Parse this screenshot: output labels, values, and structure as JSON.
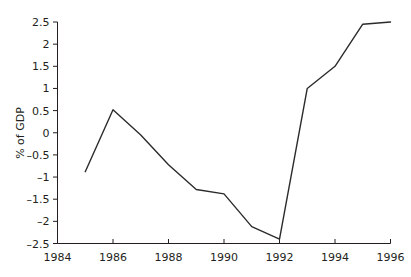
{
  "chart_data": {
    "type": "line",
    "title": "",
    "xlabel": "",
    "ylabel": "% of GDP",
    "x": [
      1985,
      1986,
      1987,
      1988,
      1989,
      1990,
      1991,
      1992,
      1993,
      1994,
      1995,
      1996
    ],
    "values": [
      -0.88,
      0.52,
      -0.05,
      -0.72,
      -1.28,
      -1.38,
      -2.12,
      -2.4,
      1.0,
      1.5,
      2.45,
      2.5
    ],
    "series": [
      {
        "name": "% of GDP",
        "values": [
          -0.88,
          0.52,
          -0.05,
          -0.72,
          -1.28,
          -1.38,
          -2.12,
          -2.4,
          1.0,
          1.5,
          2.45,
          2.5
        ]
      }
    ],
    "xlim": [
      1984,
      1996
    ],
    "ylim": [
      -2.5,
      2.5
    ],
    "xticks": [
      1984,
      1986,
      1988,
      1990,
      1992,
      1994,
      1996
    ],
    "xtick_labels": [
      "1984",
      "1986",
      "1988",
      "1990",
      "1992",
      "1994",
      "1996"
    ],
    "yticks": [
      2.5,
      2,
      1.5,
      1,
      0.5,
      0,
      -0.5,
      -1,
      -1.5,
      -2,
      -2.5
    ],
    "ytick_labels": [
      "2.5",
      "2",
      "1.5",
      "1",
      "0.5",
      "0",
      "–0.5",
      "–1",
      "–1.5",
      "–2",
      "–2.5"
    ],
    "grid": false,
    "legend": null,
    "line_color": "#2b2b2b",
    "axis_color": "#231f20",
    "background": "#ffffff"
  }
}
